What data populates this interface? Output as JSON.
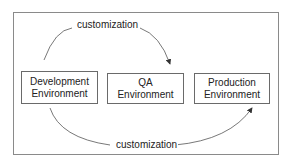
{
  "diagram": {
    "nodes": [
      {
        "id": "dev",
        "label": "Development Environment",
        "line1": "Development",
        "line2": "Environment"
      },
      {
        "id": "qa",
        "label": "QA Environment",
        "line1": "QA",
        "line2": "Environment"
      },
      {
        "id": "prod",
        "label": "Production Environment",
        "line1": "Production",
        "line2": "Environment"
      }
    ],
    "edges": [
      {
        "from": "dev",
        "to": "qa",
        "label": "customization",
        "position": "top"
      },
      {
        "from": "dev",
        "to": "prod",
        "label": "customization",
        "position": "bottom"
      }
    ],
    "colors": {
      "line": "#555555",
      "text": "#222222",
      "frame": "#8a8a8a"
    }
  }
}
